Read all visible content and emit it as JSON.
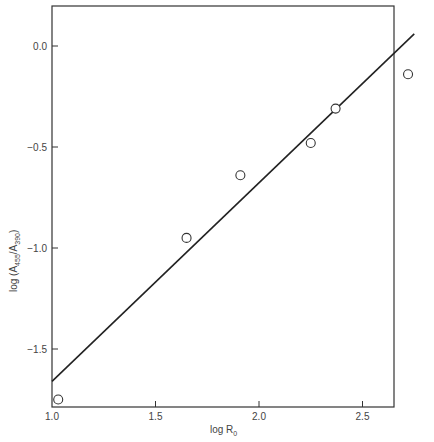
{
  "chart_data": {
    "type": "scatter",
    "title": "",
    "xlabel": "log R0",
    "ylabel": "log (A455/A390)",
    "xlim": [
      1.0,
      2.78
    ],
    "ylim": [
      -1.79,
      0.2
    ],
    "xticks": [
      1.0,
      1.5,
      2.0,
      2.5
    ],
    "xtick_labels": [
      "1.0",
      "1.5",
      "2.0",
      "2.5"
    ],
    "yticks": [
      0.0,
      -0.5,
      -1.0,
      -1.5
    ],
    "ytick_labels": [
      "0.0",
      "-0.5",
      "-1.0",
      "-1.5"
    ],
    "grid": false,
    "legend": null,
    "series": [
      {
        "name": "data",
        "marker": "open-circle",
        "points": [
          {
            "x": 1.03,
            "y": -1.75
          },
          {
            "x": 1.65,
            "y": -0.95
          },
          {
            "x": 1.91,
            "y": -0.64
          },
          {
            "x": 2.25,
            "y": -0.48
          },
          {
            "x": 2.37,
            "y": -0.31
          },
          {
            "x": 2.72,
            "y": -0.14
          }
        ]
      },
      {
        "name": "fit",
        "style": "line",
        "points": [
          {
            "x": 1.0,
            "y": -1.66
          },
          {
            "x": 2.75,
            "y": 0.06
          }
        ]
      }
    ]
  },
  "labels": {
    "x_main": "log R",
    "x_sub": "0",
    "y_prefix": "log (A",
    "y_sub1": "455",
    "y_mid": "/A",
    "y_sub2": "390",
    "y_suffix": ")"
  }
}
